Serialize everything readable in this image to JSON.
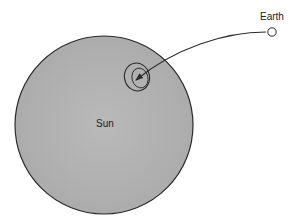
{
  "diagram": {
    "labels": {
      "earth": "Earth",
      "sun": "Sun"
    },
    "colors": {
      "sun_fill": "#b4b4b4",
      "outline": "#2a2a2a",
      "background": "#ffffff",
      "earth_fill": "#ffffff"
    }
  }
}
